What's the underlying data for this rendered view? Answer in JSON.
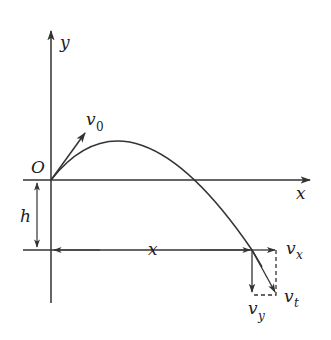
{
  "diagram": {
    "title": "",
    "type": "projectile-motion",
    "colors": {
      "stroke": "#333333",
      "background": "#ffffff"
    },
    "labels": {
      "y_axis": "y",
      "x_axis": "x",
      "origin": "O",
      "height": "h",
      "horizontal_distance": "x",
      "initial_velocity": "v",
      "initial_velocity_sub": "0",
      "vx": "v",
      "vx_sub": "x",
      "vy": "v",
      "vy_sub": "y",
      "vt": "v",
      "vt_sub": "t"
    }
  }
}
